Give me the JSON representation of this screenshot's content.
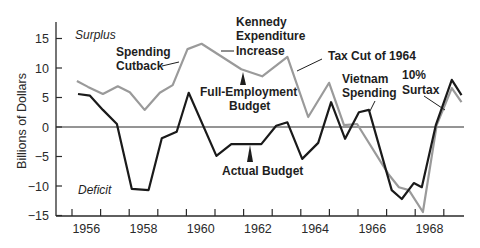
{
  "chart_data": {
    "type": "line",
    "title": "",
    "xlabel": "",
    "ylabel": "Billions of Dollars",
    "ylim": [
      -15,
      18
    ],
    "xlim": [
      1955.5,
      1969.8
    ],
    "yticks": [
      15,
      10,
      5,
      0,
      -5,
      -10,
      -15
    ],
    "ytick_labels": [
      "15",
      "10",
      "5",
      "0",
      "−5",
      "−10",
      "−15"
    ],
    "xtick_labels": [
      "1956",
      "1958",
      "1960",
      "1962",
      "1964",
      "1966",
      "1968"
    ],
    "grid": false,
    "zero_line": true,
    "legend": null,
    "series": [
      {
        "name": "Full-Employment Budget",
        "color": "#9a9a9a",
        "x": [
          1956.17,
          1956.56,
          1957.08,
          1957.6,
          1958.02,
          1958.54,
          1959.07,
          1959.52,
          1960.04,
          1960.53,
          1961.92,
          1962.65,
          1963.53,
          1964.26,
          1964.99,
          1965.51,
          1965.97,
          1967.08,
          1967.43,
          1967.78,
          1968.27,
          1968.75,
          1969.28,
          1969.62
        ],
        "values": [
          7.8,
          6.8,
          5.6,
          6.9,
          5.9,
          2.9,
          5.8,
          7.1,
          13.2,
          14.1,
          9.8,
          8.6,
          11.9,
          1.7,
          7.5,
          0.3,
          0.5,
          -8.1,
          -10.2,
          -10.7,
          -14.4,
          0.3,
          6.6,
          4.2
        ]
      },
      {
        "name": "Actual Budget",
        "color": "#1a1a1a",
        "x": [
          1956.21,
          1956.63,
          1957.08,
          1957.57,
          1958.09,
          1958.68,
          1959.14,
          1959.66,
          1960.08,
          1961.05,
          1961.57,
          1962.1,
          1962.62,
          1963.14,
          1963.53,
          1964.05,
          1964.61,
          1965.06,
          1965.55,
          1966.03,
          1966.38,
          1967.18,
          1967.53,
          1967.95,
          1968.23,
          1968.72,
          1969.28,
          1969.62
        ],
        "values": [
          5.6,
          5.3,
          2.9,
          0.5,
          -10.5,
          -10.7,
          -1.9,
          -0.8,
          5.8,
          -4.9,
          -2.9,
          -2.9,
          -2.9,
          0.2,
          0.8,
          -5.4,
          -2.7,
          4.2,
          -2.0,
          2.5,
          2.9,
          -10.7,
          -12.2,
          -9.5,
          -10.2,
          0.3,
          8.0,
          5.4
        ]
      }
    ],
    "annotations": [
      {
        "text": "Surplus",
        "style": "italic"
      },
      {
        "text": "Deficit",
        "style": "italic"
      },
      {
        "text": "Spending Cutback",
        "lines": [
          "Spending",
          "Cutback"
        ]
      },
      {
        "text": "Kennedy Expenditure Increase",
        "lines": [
          "Kennedy",
          "Expenditure",
          "Increase"
        ]
      },
      {
        "text": "Tax Cut of 1964",
        "lines": [
          "Tax Cut of 1964"
        ]
      },
      {
        "text": "Full-Employment Budget",
        "lines": [
          "Full-Employment",
          "Budget"
        ]
      },
      {
        "text": "Vietnam Spending",
        "lines": [
          "Vietnam",
          "Spending"
        ]
      },
      {
        "text": "10% Surtax",
        "lines": [
          "10%",
          "Surtax"
        ]
      },
      {
        "text": "Actual Budget",
        "lines": [
          "Actual Budget"
        ]
      }
    ]
  },
  "labels": {
    "surplus": "Surplus",
    "deficit": "Deficit",
    "spending_cutback_1": "Spending",
    "spending_cutback_2": "Cutback",
    "kennedy_1": "Kennedy",
    "kennedy_2": "Expenditure",
    "kennedy_3": "Increase",
    "tax_cut": "Tax Cut of 1964",
    "full_employment_1": "Full-Employment",
    "full_employment_2": "Budget",
    "vietnam_1": "Vietnam",
    "vietnam_2": "Spending",
    "surtax_1": "10%",
    "surtax_2": "Surtax",
    "actual_budget": "Actual Budget",
    "y_axis_title": "Billions of Dollars"
  },
  "colors": {
    "axis": "#2a2a2a",
    "full_employment": "#9a9a9a",
    "actual": "#1a1a1a"
  }
}
